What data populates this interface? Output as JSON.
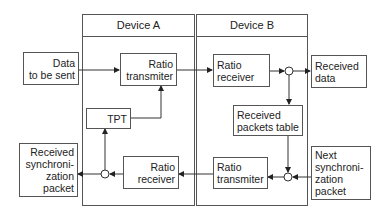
{
  "diagram": {
    "devices": [
      {
        "id": "device-a",
        "title": "Device A"
      },
      {
        "id": "device-b",
        "title": "Device B"
      }
    ],
    "external": {
      "data_to_be_sent": [
        "Data",
        "to be sent"
      ],
      "received_sync_packet": [
        "Received",
        "synchroni-",
        "zation",
        "packet"
      ],
      "received_data": [
        "Received",
        "data"
      ],
      "next_sync_packet": [
        "Next",
        "synchroni-",
        "zation",
        "packet"
      ]
    },
    "device_a_blocks": {
      "ratio_transmitter": [
        "Ratio",
        "transmiter"
      ],
      "tpt": [
        "TPT"
      ],
      "ratio_receiver": [
        "Ratio",
        "receiver"
      ]
    },
    "device_b_blocks": {
      "ratio_receiver": [
        "Ratio",
        "receiver"
      ],
      "received_packets_table": [
        "Received",
        "packets table"
      ],
      "ratio_transmitter": [
        "Ratio",
        "transmiter"
      ]
    },
    "connections": [
      {
        "from": "Data to be sent",
        "to": "Device A Ratio transmiter"
      },
      {
        "from": "Device A Ratio transmiter",
        "to": "Device B Ratio receiver"
      },
      {
        "from": "Device B Ratio receiver",
        "to": "junction-top"
      },
      {
        "from": "junction-top",
        "to": "Received data"
      },
      {
        "from": "junction-top",
        "to": "Received packets table"
      },
      {
        "from": "Received packets table",
        "to": "junction-bottom"
      },
      {
        "from": "Next synchronization packet",
        "to": "junction-bottom"
      },
      {
        "from": "junction-bottom",
        "to": "Device B Ratio transmiter"
      },
      {
        "from": "Device B Ratio transmiter",
        "to": "Device A Ratio receiver"
      },
      {
        "from": "Device A Ratio receiver",
        "to": "junction-left"
      },
      {
        "from": "junction-left",
        "to": "Received synchronization packet"
      },
      {
        "from": "junction-left",
        "to": "TPT"
      },
      {
        "from": "TPT",
        "to": "Device A Ratio transmiter"
      }
    ]
  }
}
